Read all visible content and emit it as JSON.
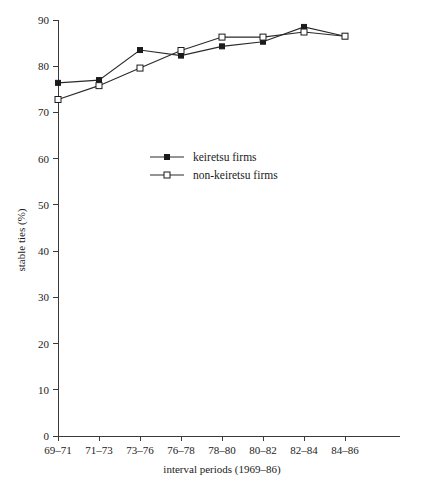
{
  "chart_data": {
    "type": "line",
    "title": "",
    "xlabel": "interval periods (1969–86)",
    "ylabel": "stable ties (%)",
    "categories": [
      "69–71",
      "71–73",
      "73–76",
      "76–78",
      "78–80",
      "80–82",
      "82–84",
      "84–86"
    ],
    "ylim": [
      0,
      90
    ],
    "yticks": [
      0,
      10,
      20,
      30,
      40,
      50,
      60,
      70,
      80,
      90
    ],
    "ytick_labels": [
      "0",
      "10",
      "20",
      "30",
      "40",
      "50",
      "60",
      "70",
      "80",
      "90"
    ],
    "grid": false,
    "legend_position": "center-left",
    "series": [
      {
        "name": "keiretsu firms",
        "marker": "filled-square",
        "values": [
          76.4,
          77.0,
          83.5,
          82.3,
          84.3,
          85.3,
          88.5,
          86.5
        ]
      },
      {
        "name": "non-keiretsu firms",
        "marker": "open-square",
        "values": [
          72.8,
          75.8,
          79.6,
          83.4,
          86.3,
          86.3,
          87.4,
          86.5
        ]
      }
    ]
  },
  "legend": {
    "entries": [
      {
        "label": "keiretsu firms"
      },
      {
        "label": "non-keiretsu firms"
      }
    ]
  }
}
